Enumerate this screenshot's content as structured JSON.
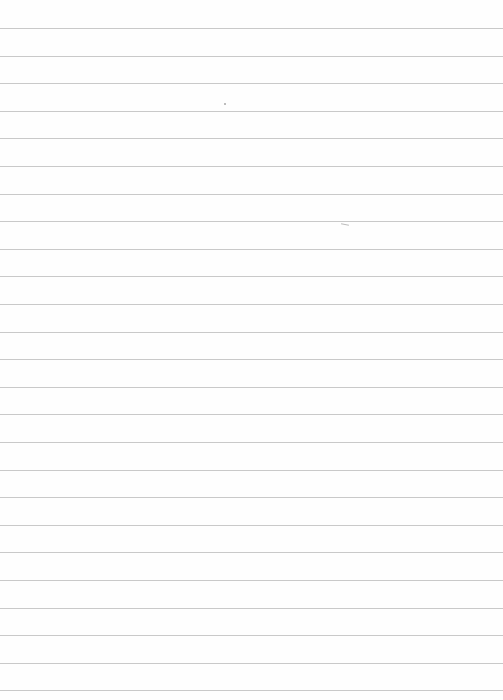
{
  "page": {
    "type": "blank-lined-paper",
    "background_color": "#fefefe",
    "rule_color": "#c9c9c9",
    "rule_count": 25,
    "first_rule_y": 28,
    "rule_spacing": 27.6,
    "text": ""
  }
}
